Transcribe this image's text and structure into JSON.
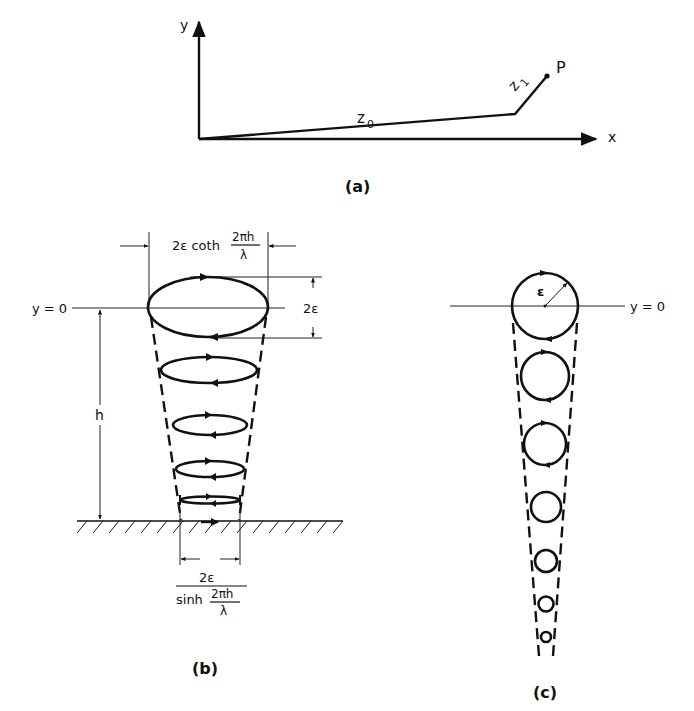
{
  "panel_a": {
    "caption": "(a)",
    "y_axis_label": "y",
    "x_axis_label": "x",
    "segment_z0_label": "z",
    "segment_z0_sub": "0",
    "segment_z1_label": "z",
    "segment_z1_sub": "1",
    "point_label": "P"
  },
  "panel_b": {
    "caption": "(b)",
    "y0_label": "y = 0",
    "height_label": "h",
    "top_width_label": "2ε coth",
    "top_width_frac_num": "2πh",
    "top_width_frac_den": "λ",
    "vertical_dim_label": "2ε",
    "bottom_width_num": "2ε",
    "bottom_width_den_prefix": "sinh",
    "bottom_width_den_frac_num": "2πh",
    "bottom_width_den_frac_den": "λ",
    "ellipse_count": 5
  },
  "panel_c": {
    "caption": "(c)",
    "y0_label": "y = 0",
    "radius_label": "ε",
    "circle_count": 7
  }
}
